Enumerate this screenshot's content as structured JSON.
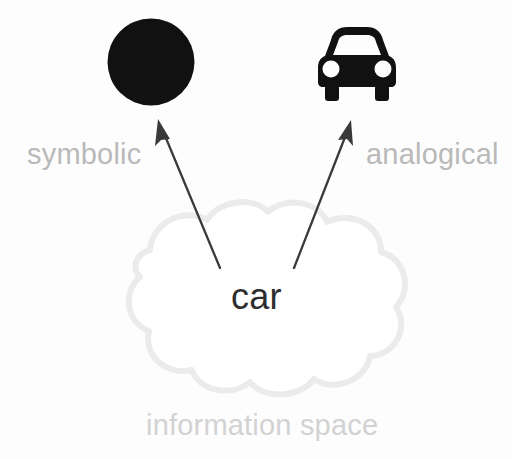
{
  "diagram": {
    "background_color": "#fdfdfd",
    "nodes": {
      "symbolic_glyph": {
        "icon": "filled-circle-icon",
        "shape": "circle",
        "color": "#111111",
        "center_x": 151,
        "center_y": 62,
        "diameter": 87
      },
      "analogical_glyph": {
        "icon": "car-icon",
        "shape": "car-pictogram",
        "color": "#111111",
        "x": 317,
        "y": 27,
        "width": 79,
        "height": 74
      },
      "cloud": {
        "icon": "cloud-shape",
        "outline_color": "#ebebeb",
        "fill_color": "#ffffff",
        "x": 80,
        "y": 208,
        "width": 332,
        "height": 192
      }
    },
    "labels": {
      "symbolic": "symbolic",
      "analogical": "analogical",
      "concept": "car",
      "information_space": "information space"
    },
    "colors": {
      "label_gray": "#b9b9b9",
      "cloud_label_gray": "#d2d2d2",
      "concept_text": "#2e2e2e",
      "glyph_black": "#111111",
      "arrow_stroke": "#3a3a3a"
    },
    "arrows": [
      {
        "name": "arrow-to-symbolic",
        "from_label": "car",
        "to_label": "symbolic",
        "tail_x": 220,
        "tail_y": 268,
        "tip_x": 158,
        "tip_y": 119,
        "stroke": "#3a3a3a"
      },
      {
        "name": "arrow-to-analogical",
        "from_label": "car",
        "to_label": "analogical",
        "tail_x": 294,
        "tail_y": 268,
        "tip_x": 351,
        "tip_y": 120,
        "stroke": "#3a3a3a"
      }
    ]
  }
}
